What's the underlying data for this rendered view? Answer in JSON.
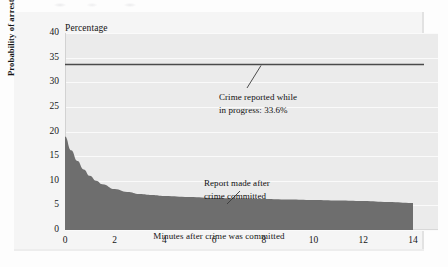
{
  "chart_data": {
    "type": "area",
    "title": "",
    "unit_label": "Percentage",
    "xlabel": "Minutes after crime was committed",
    "ylabel": "Probability of arrest",
    "xlim": [
      0,
      14
    ],
    "ylim": [
      0,
      40
    ],
    "grid": true,
    "legend_position": "none",
    "xticks": [
      0,
      2,
      4,
      6,
      8,
      10,
      12,
      14
    ],
    "xtick_labels": [
      "0",
      "2",
      "4",
      "6",
      "8",
      "10",
      "12",
      "14"
    ],
    "yticks": [
      0,
      5,
      10,
      15,
      20,
      25,
      30,
      35,
      40
    ],
    "ytick_labels": [
      "0",
      "5",
      "10",
      "15",
      "20",
      "25",
      "30",
      "35",
      "40"
    ],
    "series": [
      {
        "name": "Report made after crime committed",
        "type": "area",
        "color": "#6e6e6e",
        "x": [
          0,
          0.25,
          0.5,
          0.75,
          1,
          1.25,
          1.5,
          2,
          2.5,
          3,
          3.5,
          4,
          5,
          6,
          7,
          8,
          9,
          10,
          11,
          12,
          13,
          14
        ],
        "values": [
          19.0,
          16.2,
          14.0,
          12.3,
          11.0,
          10.0,
          9.3,
          8.3,
          7.7,
          7.3,
          7.1,
          6.9,
          6.7,
          6.5,
          6.4,
          6.3,
          6.2,
          6.1,
          6.0,
          5.9,
          5.7,
          5.5
        ]
      },
      {
        "name": "Crime reported while in progress",
        "type": "hline",
        "color": "#4a4a4a",
        "value": 33.6
      }
    ],
    "annotations": [
      {
        "id": "reported-in-progress",
        "text": "Crime reported while\nin progress: 33.6%",
        "target_value": 33.6
      },
      {
        "id": "report-after",
        "text": "Report made after\ncrime committed",
        "target_value": 6.6
      }
    ]
  }
}
